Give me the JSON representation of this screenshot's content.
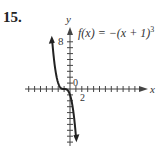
{
  "problem": {
    "number": "15."
  },
  "chart_data": {
    "type": "line",
    "function": "f(x) = -(x + 1)^3",
    "xlabel": "x",
    "ylabel": "y",
    "x_tick_labels": [
      {
        "value": 2,
        "label": "2"
      }
    ],
    "y_tick_labels": [
      {
        "value": 8,
        "label": "8"
      }
    ],
    "origin_label": "0",
    "xlim": [
      -7,
      12
    ],
    "ylim": [
      -9,
      9
    ],
    "x_tick_step": 1,
    "y_tick_step": 1,
    "grid": false,
    "series": [
      {
        "name": "f(x) = -(x + 1)^3",
        "x": [
          -3,
          -2.5,
          -2,
          -1.5,
          -1,
          -0.5,
          0,
          0.5,
          1
        ],
        "y": [
          8,
          3.375,
          1,
          0.125,
          0,
          -0.125,
          -1,
          -3.375,
          -8
        ]
      }
    ]
  },
  "labels": {
    "func_prefix": "f(x) = −(x + 1)",
    "func_exp": "3",
    "y_axis": "y",
    "x_axis": "x",
    "tick_8": "8",
    "tick_2": "2",
    "origin": "0"
  },
  "colors": {
    "axis": "#444444",
    "curve": "#222222"
  }
}
